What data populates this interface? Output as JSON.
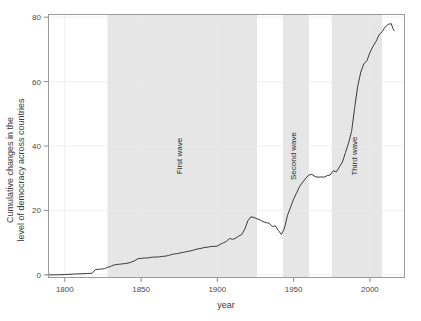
{
  "chart_data": {
    "type": "line",
    "title": "",
    "xlabel": "year",
    "ylabel": "Cumulative changes in the level of democracy across countries",
    "ylabel_line1": "Cumulative changes in the",
    "ylabel_line2": "level of democracy across countries",
    "xlim": [
      1789,
      2023
    ],
    "ylim": [
      -1,
      81
    ],
    "xticks": [
      1800,
      1850,
      1900,
      1950,
      2000
    ],
    "xtick_labels": [
      "1800",
      "1850",
      "1900",
      "1950",
      "2000"
    ],
    "yticks": [
      0,
      20,
      40,
      60,
      80
    ],
    "ytick_labels": [
      "0",
      "20",
      "40",
      "60",
      "80"
    ],
    "grid": true,
    "legend": "none",
    "line_color": "#3b3b3b",
    "band_color": "#e6e6e6",
    "annotations": [
      {
        "label": "First wave",
        "x_start": 1828,
        "x_end": 1926,
        "orientation": "vertical"
      },
      {
        "label": "Second wave",
        "x_start": 1943,
        "x_end": 1960,
        "orientation": "vertical"
      },
      {
        "label": "Third wave",
        "x_start": 1975,
        "x_end": 2008,
        "orientation": "vertical"
      }
    ],
    "series": [
      {
        "name": "Cumulative changes in the level of democracy",
        "x": [
          1789,
          1795,
          1800,
          1805,
          1810,
          1815,
          1818,
          1820,
          1822,
          1824,
          1826,
          1828,
          1830,
          1832,
          1834,
          1836,
          1838,
          1840,
          1842,
          1844,
          1846,
          1848,
          1850,
          1852,
          1854,
          1856,
          1858,
          1860,
          1862,
          1864,
          1866,
          1868,
          1870,
          1872,
          1874,
          1876,
          1878,
          1880,
          1882,
          1884,
          1886,
          1888,
          1890,
          1892,
          1894,
          1896,
          1898,
          1900,
          1902,
          1904,
          1906,
          1908,
          1910,
          1912,
          1914,
          1916,
          1918,
          1920,
          1922,
          1924,
          1926,
          1928,
          1930,
          1932,
          1934,
          1936,
          1938,
          1940,
          1942,
          1944,
          1946,
          1948,
          1950,
          1952,
          1954,
          1956,
          1958,
          1960,
          1962,
          1964,
          1966,
          1968,
          1970,
          1972,
          1974,
          1976,
          1978,
          1980,
          1982,
          1984,
          1986,
          1988,
          1990,
          1992,
          1994,
          1996,
          1998,
          2000,
          2002,
          2004,
          2006,
          2008,
          2010,
          2012,
          2014,
          2015,
          2016
        ],
        "y": [
          0,
          0,
          0.1,
          0.2,
          0.3,
          0.4,
          0.5,
          1.6,
          1.7,
          1.8,
          1.9,
          2.3,
          2.6,
          3.0,
          3.2,
          3.3,
          3.4,
          3.5,
          3.7,
          4.0,
          4.4,
          5.0,
          5.1,
          5.2,
          5.2,
          5.4,
          5.5,
          5.5,
          5.6,
          5.7,
          5.8,
          6.0,
          6.3,
          6.5,
          6.6,
          6.8,
          7.0,
          7.2,
          7.4,
          7.6,
          7.9,
          8.1,
          8.3,
          8.5,
          8.6,
          8.8,
          8.8,
          8.9,
          9.5,
          9.9,
          10.4,
          11.3,
          11.0,
          11.4,
          12.0,
          12.5,
          14.2,
          16.8,
          18.0,
          17.8,
          17.4,
          17.0,
          16.5,
          16.2,
          16.0,
          15.0,
          15.2,
          13.8,
          12.5,
          14.5,
          18.5,
          21.0,
          23.5,
          25.5,
          27.5,
          28.8,
          30.0,
          31.0,
          31.2,
          30.5,
          30.3,
          30.4,
          30.3,
          30.8,
          31.0,
          32.3,
          32.0,
          33.5,
          35.0,
          38.0,
          41.0,
          44.5,
          52.0,
          58.5,
          63.0,
          65.5,
          66.5,
          69.0,
          71.0,
          72.5,
          74.5,
          75.5,
          77.0,
          77.8,
          78.0,
          76.5,
          75.8
        ]
      }
    ]
  }
}
